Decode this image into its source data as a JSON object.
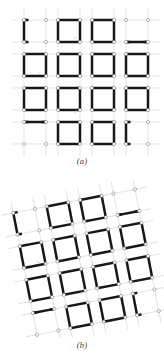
{
  "document": {
    "kind": "scientific-figure",
    "description": "Two-panel figure of a rotating-squares mechanical metamaterial lattice",
    "background_color": "#ffffff",
    "width": 164,
    "height": 360
  },
  "style": {
    "bar_color": "#171717",
    "bar_width": 2.5,
    "node_fill": "#fdfdfd",
    "node_stroke": "#7a7a7a",
    "node_radius": 1.6,
    "grid_color": "#d8d8d8",
    "grid_width": 0.7,
    "annotation_color": "#c9c9c9",
    "caption_color": "#3b3b3b"
  },
  "panels": [
    {
      "id": "panel-a",
      "caption": "(a)",
      "state_label": "undeformed",
      "rotation_deg": 0,
      "lattice": {
        "rows": 4,
        "cols": 4,
        "pitch_x": 34,
        "pitch_y": 34,
        "square_size": 22,
        "origin_x": 24,
        "origin_y": 20
      },
      "annotations": [
        {
          "text": "a",
          "x": 75,
          "y": 39
        },
        {
          "text": "b",
          "x": 39,
          "y": 75
        },
        {
          "text": "c",
          "x": 110,
          "y": 75
        },
        {
          "text": "d",
          "x": 75,
          "y": 113
        }
      ],
      "cells": [
        {
          "row": 0,
          "col": 0,
          "type": "partial",
          "edges": [
            "left"
          ],
          "stubs": [
            "top-left",
            "bottom-left"
          ]
        },
        {
          "row": 0,
          "col": 1,
          "type": "full",
          "edges": [
            "top",
            "right",
            "bottom",
            "left"
          ]
        },
        {
          "row": 0,
          "col": 2,
          "type": "full",
          "edges": [
            "top",
            "right",
            "bottom",
            "left"
          ]
        },
        {
          "row": 0,
          "col": 3,
          "type": "partial",
          "edges": [
            "bottom"
          ],
          "stubs": [
            "bottom-left",
            "bottom-right"
          ]
        },
        {
          "row": 1,
          "col": 0,
          "type": "full",
          "edges": [
            "top",
            "right",
            "bottom",
            "left"
          ]
        },
        {
          "row": 1,
          "col": 1,
          "type": "full",
          "edges": [
            "top",
            "right",
            "bottom",
            "left"
          ]
        },
        {
          "row": 1,
          "col": 2,
          "type": "full",
          "edges": [
            "top",
            "right",
            "bottom",
            "left"
          ]
        },
        {
          "row": 1,
          "col": 3,
          "type": "full",
          "edges": [
            "top",
            "right",
            "bottom",
            "left"
          ]
        },
        {
          "row": 2,
          "col": 0,
          "type": "full",
          "edges": [
            "top",
            "right",
            "bottom",
            "left"
          ]
        },
        {
          "row": 2,
          "col": 1,
          "type": "full",
          "edges": [
            "top",
            "right",
            "bottom",
            "left"
          ]
        },
        {
          "row": 2,
          "col": 2,
          "type": "full",
          "edges": [
            "top",
            "right",
            "bottom",
            "left"
          ]
        },
        {
          "row": 2,
          "col": 3,
          "type": "full",
          "edges": [
            "top",
            "right",
            "bottom",
            "left"
          ]
        },
        {
          "row": 3,
          "col": 0,
          "type": "partial",
          "edges": [
            "top"
          ],
          "stubs": [
            "top-left",
            "top-right"
          ]
        },
        {
          "row": 3,
          "col": 1,
          "type": "full",
          "edges": [
            "top",
            "right",
            "bottom",
            "left"
          ]
        },
        {
          "row": 3,
          "col": 2,
          "type": "full",
          "edges": [
            "top",
            "right",
            "bottom",
            "left"
          ]
        },
        {
          "row": 3,
          "col": 3,
          "type": "partial",
          "edges": [
            "left"
          ],
          "stubs": [
            "top-left",
            "bottom-left"
          ]
        }
      ]
    },
    {
      "id": "panel-b",
      "caption": "(b)",
      "state_label": "rotated",
      "rotation_deg": -11,
      "lattice": {
        "rows": 4,
        "cols": 4,
        "pitch_x": 34,
        "pitch_y": 34,
        "square_size": 22,
        "origin_x": 24,
        "origin_y": 20
      },
      "annotations": [
        {
          "text": "a",
          "x": 75,
          "y": 39
        },
        {
          "text": "b",
          "x": 39,
          "y": 75
        },
        {
          "text": "c",
          "x": 110,
          "y": 75
        },
        {
          "text": "d",
          "x": 75,
          "y": 113
        }
      ],
      "cells": [
        {
          "row": 0,
          "col": 0,
          "type": "partial",
          "edges": [
            "left"
          ],
          "stubs": [
            "top-left",
            "bottom-left"
          ]
        },
        {
          "row": 0,
          "col": 1,
          "type": "full",
          "edges": [
            "top",
            "right",
            "bottom",
            "left"
          ]
        },
        {
          "row": 0,
          "col": 2,
          "type": "full",
          "edges": [
            "top",
            "right",
            "bottom",
            "left"
          ]
        },
        {
          "row": 0,
          "col": 3,
          "type": "partial",
          "edges": [
            "bottom"
          ],
          "stubs": [
            "bottom-left",
            "bottom-right"
          ]
        },
        {
          "row": 1,
          "col": 0,
          "type": "full",
          "edges": [
            "top",
            "right",
            "bottom",
            "left"
          ]
        },
        {
          "row": 1,
          "col": 1,
          "type": "full",
          "edges": [
            "top",
            "right",
            "bottom",
            "left"
          ]
        },
        {
          "row": 1,
          "col": 2,
          "type": "full",
          "edges": [
            "top",
            "right",
            "bottom",
            "left"
          ]
        },
        {
          "row": 1,
          "col": 3,
          "type": "full",
          "edges": [
            "top",
            "right",
            "bottom",
            "left"
          ]
        },
        {
          "row": 2,
          "col": 0,
          "type": "full",
          "edges": [
            "top",
            "right",
            "bottom",
            "left"
          ]
        },
        {
          "row": 2,
          "col": 1,
          "type": "full",
          "edges": [
            "top",
            "right",
            "bottom",
            "left"
          ]
        },
        {
          "row": 2,
          "col": 2,
          "type": "full",
          "edges": [
            "top",
            "right",
            "bottom",
            "left"
          ]
        },
        {
          "row": 2,
          "col": 3,
          "type": "full",
          "edges": [
            "top",
            "right",
            "bottom",
            "left"
          ]
        },
        {
          "row": 3,
          "col": 0,
          "type": "partial",
          "edges": [
            "top"
          ],
          "stubs": [
            "top-left",
            "top-right"
          ]
        },
        {
          "row": 3,
          "col": 1,
          "type": "full",
          "edges": [
            "top",
            "right",
            "bottom",
            "left"
          ]
        },
        {
          "row": 3,
          "col": 2,
          "type": "full",
          "edges": [
            "top",
            "right",
            "bottom",
            "left"
          ]
        },
        {
          "row": 3,
          "col": 3,
          "type": "partial",
          "edges": [
            "left"
          ],
          "stubs": [
            "top-left",
            "bottom-left"
          ]
        }
      ]
    }
  ]
}
